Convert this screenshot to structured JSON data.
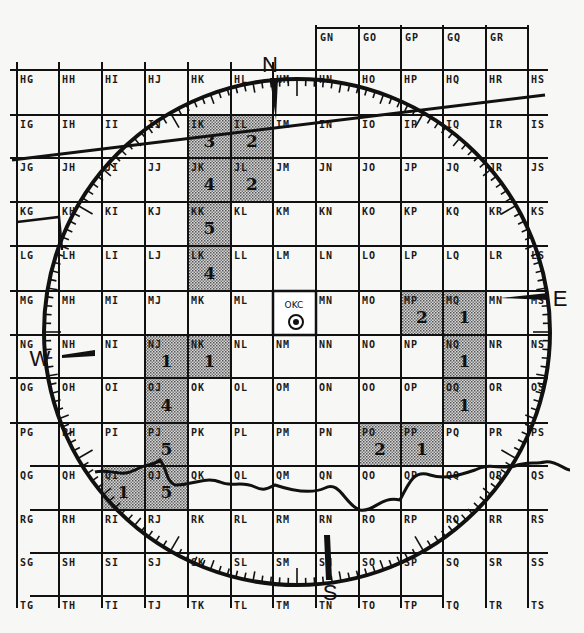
{
  "map": {
    "title": "",
    "station": {
      "label": "OKC",
      "cell": "MM"
    },
    "cardinals": {
      "north": "N",
      "south": "S",
      "east": "E",
      "west": "W"
    },
    "grid": {
      "columns": [
        "G",
        "H",
        "I",
        "J",
        "K",
        "L",
        "M",
        "N",
        "O",
        "P",
        "Q",
        "R",
        "S"
      ],
      "rows": [
        "H",
        "I",
        "J",
        "K",
        "L",
        "M",
        "N",
        "O",
        "P",
        "Q",
        "R",
        "S",
        "T"
      ],
      "top_partial_row": {
        "row": "G",
        "cells": [
          "GN",
          "GO",
          "GP",
          "GQ",
          "GR"
        ]
      }
    },
    "cell_labels": [
      [
        "HG",
        "HH",
        "HI",
        "HJ",
        "HK",
        "HL",
        "HM",
        "HN",
        "HO",
        "HP",
        "HQ",
        "HR",
        "HS"
      ],
      [
        "IG",
        "IH",
        "II",
        "IJ",
        "IK",
        "IL",
        "IM",
        "IN",
        "IO",
        "IP",
        "IQ",
        "IR",
        "IS"
      ],
      [
        "JG",
        "JH",
        "JI",
        "JJ",
        "JK",
        "JL",
        "JM",
        "JN",
        "JO",
        "JP",
        "JQ",
        "JR",
        "JS"
      ],
      [
        "KG",
        "KH",
        "KI",
        "KJ",
        "KK",
        "KL",
        "KM",
        "KN",
        "KO",
        "KP",
        "KQ",
        "KR",
        "KS"
      ],
      [
        "LG",
        "LH",
        "LI",
        "LJ",
        "LK",
        "LL",
        "LM",
        "LN",
        "LO",
        "LP",
        "LQ",
        "LR",
        "LS"
      ],
      [
        "MG",
        "MH",
        "MI",
        "MJ",
        "MK",
        "ML",
        "",
        "MN",
        "MO",
        "MP",
        "MQ",
        "MN",
        "MS"
      ],
      [
        "NG",
        "NH",
        "NI",
        "NJ",
        "NK",
        "NL",
        "NM",
        "NN",
        "NO",
        "NP",
        "NQ",
        "NR",
        "NS"
      ],
      [
        "OG",
        "OH",
        "OI",
        "OJ",
        "OK",
        "OL",
        "OM",
        "ON",
        "OO",
        "OP",
        "OQ",
        "OR",
        "OS"
      ],
      [
        "PG",
        "PH",
        "PI",
        "PJ",
        "PK",
        "PL",
        "PM",
        "PN",
        "PO",
        "PP",
        "PQ",
        "PR",
        "PS"
      ],
      [
        "QG",
        "QH",
        "QI",
        "QJ",
        "QK",
        "QL",
        "QM",
        "QN",
        "QO",
        "QP",
        "QQ",
        "QR",
        "QS"
      ],
      [
        "RG",
        "RH",
        "RI",
        "RJ",
        "RK",
        "RL",
        "RM",
        "RN",
        "RO",
        "RP",
        "RQ",
        "RR",
        "RS"
      ],
      [
        "SG",
        "SH",
        "SI",
        "SJ",
        "SK",
        "SL",
        "SM",
        "SN",
        "SO",
        "SP",
        "SQ",
        "SR",
        "SS"
      ],
      [
        "TG",
        "TH",
        "TI",
        "TJ",
        "TK",
        "TL",
        "TM",
        "TN",
        "TO",
        "TP",
        "TQ",
        "TR",
        "TS"
      ]
    ],
    "shaded_cells": [
      {
        "cell": "IK",
        "count": "3"
      },
      {
        "cell": "IL",
        "count": "2"
      },
      {
        "cell": "JK",
        "count": "4"
      },
      {
        "cell": "JL",
        "count": "2"
      },
      {
        "cell": "KK",
        "count": "5"
      },
      {
        "cell": "LK",
        "count": "4"
      },
      {
        "cell": "MP",
        "count": "2"
      },
      {
        "cell": "MQ",
        "count": "1"
      },
      {
        "cell": "NJ",
        "count": "1"
      },
      {
        "cell": "NK",
        "count": "1"
      },
      {
        "cell": "NQ",
        "count": "1"
      },
      {
        "cell": "OJ",
        "count": "4"
      },
      {
        "cell": "OQ",
        "count": "1"
      },
      {
        "cell": "PJ",
        "count": "5"
      },
      {
        "cell": "PO",
        "count": "2"
      },
      {
        "cell": "PP",
        "count": "1"
      },
      {
        "cell": "QI",
        "count": "1"
      },
      {
        "cell": "QJ",
        "count": "5"
      }
    ],
    "range_ring": {
      "label": "radar range circle with degree ticks"
    },
    "features": [
      "state boundary line (upper)",
      "river (Red River) along bottom",
      "county line (left)"
    ]
  }
}
